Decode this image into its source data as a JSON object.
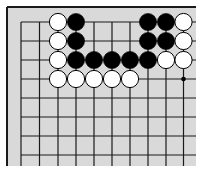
{
  "board": {
    "background": "#d9d9d9",
    "line_color": "#1a1a1a",
    "frame": {
      "left": 7,
      "top": 7,
      "right": 196,
      "bottom": 166
    },
    "columns_x": [
      21,
      39.5,
      58,
      76,
      94,
      112,
      130,
      148,
      166,
      183.5
    ],
    "rows_y": [
      22,
      41,
      60,
      79,
      98,
      117,
      136,
      155
    ],
    "edges": {
      "left": true,
      "top": true,
      "right": false,
      "bottom": false
    },
    "star_points": [
      {
        "col": 9,
        "row": 3
      }
    ],
    "stone_radius": 8.6,
    "stones": [
      {
        "col": 2,
        "row": 0,
        "color": "white"
      },
      {
        "col": 3,
        "row": 0,
        "color": "black"
      },
      {
        "col": 7,
        "row": 0,
        "color": "black"
      },
      {
        "col": 8,
        "row": 0,
        "color": "black"
      },
      {
        "col": 9,
        "row": 0,
        "color": "white"
      },
      {
        "col": 2,
        "row": 1,
        "color": "white"
      },
      {
        "col": 3,
        "row": 1,
        "color": "black"
      },
      {
        "col": 7,
        "row": 1,
        "color": "black"
      },
      {
        "col": 8,
        "row": 1,
        "color": "black"
      },
      {
        "col": 9,
        "row": 1,
        "color": "white"
      },
      {
        "col": 2,
        "row": 2,
        "color": "white"
      },
      {
        "col": 3,
        "row": 2,
        "color": "black"
      },
      {
        "col": 4,
        "row": 2,
        "color": "black"
      },
      {
        "col": 5,
        "row": 2,
        "color": "black"
      },
      {
        "col": 6,
        "row": 2,
        "color": "black"
      },
      {
        "col": 7,
        "row": 2,
        "color": "black"
      },
      {
        "col": 8,
        "row": 2,
        "color": "white"
      },
      {
        "col": 9,
        "row": 2,
        "color": "white"
      },
      {
        "col": 2,
        "row": 3,
        "color": "white"
      },
      {
        "col": 3,
        "row": 3,
        "color": "white"
      },
      {
        "col": 4,
        "row": 3,
        "color": "white"
      },
      {
        "col": 5,
        "row": 3,
        "color": "white"
      },
      {
        "col": 6,
        "row": 3,
        "color": "white"
      }
    ]
  }
}
